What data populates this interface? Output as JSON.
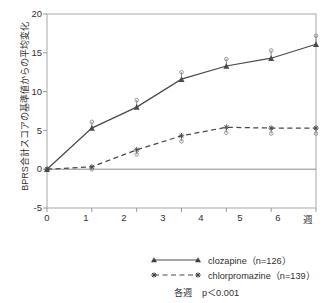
{
  "chart_data": {
    "type": "line",
    "title": "",
    "xlabel": "週",
    "ylabel": "BPRS合計スコアの基準値からの平均変化",
    "x": [
      0,
      1,
      2,
      3,
      4,
      5,
      6
    ],
    "xticklabels": [
      "0",
      "1",
      "2",
      "3",
      "4",
      "5",
      "6"
    ],
    "yticklabels": [
      "20",
      "15",
      "10",
      "5",
      "0",
      "-5"
    ],
    "yticks": [
      20,
      15,
      10,
      5,
      0,
      -5
    ],
    "xlim": [
      0,
      6
    ],
    "ylim": [
      -5,
      20
    ],
    "grid": false,
    "legend_position": "below",
    "series": [
      {
        "name": "clozapine（n=126）",
        "label": "clozapine（n=126）",
        "marker": "triangle",
        "linestyle": "solid",
        "color": "#4a4a4a",
        "values": [
          0,
          5.3,
          8.0,
          11.6,
          13.3,
          14.3,
          16.1
        ],
        "errors_upper": [
          0,
          6.1,
          8.9,
          12.5,
          14.2,
          15.3,
          17.2
        ]
      },
      {
        "name": "chlorpromazine（n=139）",
        "label": "chlorpromazine（n=139）",
        "marker": "asterisk",
        "linestyle": "dashed",
        "color": "#4a4a4a",
        "values": [
          0,
          0.3,
          2.5,
          4.3,
          5.4,
          5.3,
          5.3
        ],
        "errors_lower": [
          0,
          0.0,
          1.9,
          3.6,
          4.7,
          4.6,
          4.6
        ]
      }
    ],
    "annotations": [
      {
        "label": "各週",
        "value": "p＜0.001"
      }
    ]
  },
  "axis": {
    "y_label": "BPRS合計スコアの基準値からの平均変化",
    "x_title": "週",
    "y_ticks": [
      "20",
      "15",
      "10",
      "5",
      "0",
      "-5"
    ],
    "x_ticks": [
      "0",
      "1",
      "2",
      "3",
      "4",
      "5",
      "6"
    ]
  },
  "legend": {
    "entries": [
      {
        "label": "clozapine（n=126）"
      },
      {
        "label": "chlorpromazine（n=139）"
      }
    ],
    "note_label": "各週",
    "note_value": "p＜0.001"
  },
  "colors": {
    "line": "#4a4a4a",
    "axis": "#9a9a9a",
    "text": "#303030"
  }
}
